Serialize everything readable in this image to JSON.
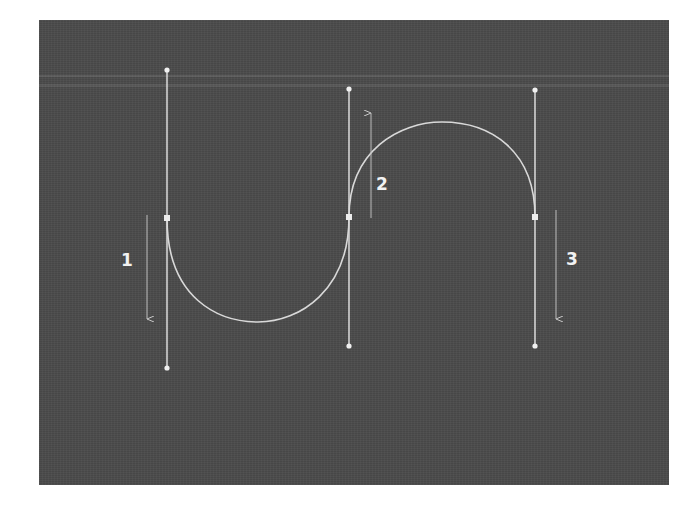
{
  "diagram": {
    "colors": {
      "background": "#4b4b4b",
      "curve": "#d9d9d9",
      "handle_line": "#e6e6e6",
      "anchor": "#e8e8e8",
      "arrow": "#bfbfbf",
      "label": "#f2f2f2"
    },
    "anchors": [
      {
        "id": "anchor-1",
        "x": 167,
        "y": 218,
        "handle_top": 70,
        "handle_bottom": 368
      },
      {
        "id": "anchor-2",
        "x": 349,
        "y": 217,
        "handle_top": 89,
        "handle_bottom": 346
      },
      {
        "id": "anchor-3",
        "x": 535,
        "y": 217,
        "handle_top": 90,
        "handle_bottom": 346
      }
    ],
    "arrows": [
      {
        "id": "arrow-1",
        "x": 147,
        "y1": 215,
        "y2": 319,
        "direction": "down",
        "label": "1",
        "label_x": 121,
        "label_y": 252
      },
      {
        "id": "arrow-2",
        "x": 371,
        "y1": 218,
        "y2": 113,
        "direction": "up",
        "label": "2",
        "label_x": 376,
        "label_y": 177
      },
      {
        "id": "arrow-3",
        "x": 556,
        "y1": 210,
        "y2": 319,
        "direction": "down",
        "label": "3",
        "label_x": 566,
        "label_y": 252
      }
    ],
    "labels": [
      "1",
      "2",
      "3"
    ]
  }
}
